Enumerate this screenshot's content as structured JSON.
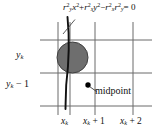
{
  "figure": {
    "background_color": "#ffffff",
    "line_color": "#555555",
    "curve_color": "#111111",
    "pixel_fill_color": "#6e6e6e",
    "pixel_stroke_color": "#3a3a3a",
    "dot_color": "#000000"
  },
  "equation": {
    "r_y": "r",
    "r_y_sub": "y",
    "r_y_sup": "2",
    "x_var": "x",
    "x_sup": "2",
    "plus": "+",
    "r_x": "r",
    "r_x_sub": "x",
    "r_x_sup": "2",
    "y_var": "y",
    "y_sup": "2",
    "minus": "−",
    "r_x2": "r",
    "r_x2_sub": "x",
    "r_x2_sup": "2",
    "r_y2": "r",
    "r_y2_sub": "y",
    "r_y2_sup": "2",
    "equals": "= 0",
    "full_text": "r_y^2 x^2 + r_x^2 y^2 − r_x^2 r_y^2 = 0"
  },
  "axes": {
    "y_labels": [
      {
        "base": "y",
        "sub": "k",
        "suffix": "",
        "text": "y_k"
      },
      {
        "base": "y",
        "sub": "k",
        "suffix": " − 1",
        "text": "y_k − 1"
      }
    ],
    "x_labels": [
      {
        "base": "x",
        "sub": "k",
        "suffix": "",
        "text": "x_k"
      },
      {
        "base": "x",
        "sub": "k",
        "suffix": " + 1",
        "text": "x_k + 1"
      },
      {
        "base": "x",
        "sub": "k",
        "suffix": " + 2",
        "text": "x_k + 2"
      }
    ]
  },
  "annotations": {
    "midpoint_label": "midpoint"
  },
  "grid": {
    "vertical_x": [
      58,
      70,
      95,
      133
    ],
    "horizontal_y": [
      40,
      73,
      106
    ],
    "h_line_x_start": 40,
    "h_line_x_end": 152,
    "v_line_y_start": 22,
    "v_line_y_end": 115
  },
  "elements": {
    "pixel_circle": {
      "cx": 72.5,
      "cy": 57.5,
      "r": 15.5
    },
    "midpoint_dot": {
      "cx": 88,
      "cy": 85,
      "r": 2.6
    },
    "curve": {
      "x_top": 67.5,
      "y_top": 17,
      "x_bottom": 65.5,
      "y_bottom": 109
    },
    "leader_line": {
      "x1": 63,
      "y1": 34,
      "x2": 74,
      "y2": 20
    },
    "midpoint_leader": {
      "x1": 89.5,
      "y1": 86.5,
      "x2": 96,
      "y2": 91
    }
  }
}
